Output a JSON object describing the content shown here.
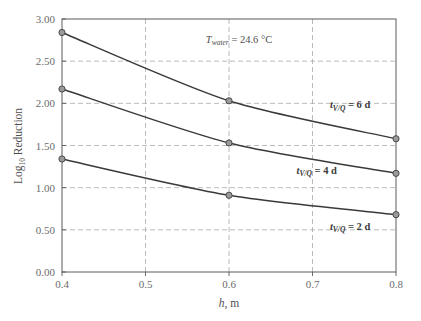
{
  "chart_data": {
    "type": "line",
    "title": "",
    "subtitle": "",
    "xlabel": "h, m",
    "xlabel_italic_part": "h",
    "xlabel_rest": ", m",
    "ylabel": "Log10 Reduction",
    "ylabel_base": "Log",
    "ylabel_sub": "10",
    "ylabel_rest": " Reduction",
    "xlim": [
      0.4,
      0.8
    ],
    "ylim": [
      0.0,
      3.0
    ],
    "xticks": [
      "0.4",
      "0.5",
      "0.6",
      "0.7",
      "0.8"
    ],
    "xtick_values": [
      0.4,
      0.5,
      0.6,
      0.7,
      0.8
    ],
    "yticks": [
      "0.00",
      "0.50",
      "1.00",
      "1.50",
      "2.00",
      "2.50",
      "3.00"
    ],
    "ytick_values": [
      0.0,
      0.5,
      1.0,
      1.5,
      2.0,
      2.5,
      3.0
    ],
    "grid": true,
    "grid_style": "dashed",
    "grid_color": "#a8a8a8",
    "legend_position": "inline-labels",
    "x": [
      0.4,
      0.6,
      0.8
    ],
    "series": [
      {
        "name": "t_V/Q = 6 d",
        "values": [
          2.84,
          2.03,
          1.58
        ],
        "color": "#3a3a3a",
        "marker": "circle-open"
      },
      {
        "name": "t_V/Q = 4 d",
        "values": [
          2.17,
          1.53,
          1.17
        ],
        "color": "#3a3a3a",
        "marker": "circle-open"
      },
      {
        "name": "t_V/Q = 2 d",
        "values": [
          1.34,
          0.91,
          0.68
        ],
        "color": "#3a3a3a",
        "marker": "circle-open"
      }
    ],
    "annotations": [
      {
        "name": "water-temperature",
        "text": "T_water = 24.6 °C",
        "symbol": "T",
        "subscript": "water",
        "rest": " = 24.6 °C",
        "x": 0.612,
        "y": 2.72
      }
    ],
    "curve_labels": [
      {
        "symbol": "t",
        "subscript": "V/Q",
        "rest": " = 6 d",
        "x": 0.745,
        "y": 1.94
      },
      {
        "symbol": "t",
        "subscript": "V/Q",
        "rest": " = 4 d",
        "x": 0.705,
        "y": 1.165
      },
      {
        "symbol": "t",
        "subscript": "V/Q",
        "rest": " = 2 d",
        "x": 0.745,
        "y": 0.5
      }
    ]
  },
  "colors": {
    "frame": "#5a5a5a",
    "grid": "#a8a8a8",
    "line": "#3a3a3a",
    "marker_fill": "#9a9a9a",
    "marker_stroke": "#4a4a4a",
    "text": "#4f4f4f",
    "background": "#ffffff"
  }
}
